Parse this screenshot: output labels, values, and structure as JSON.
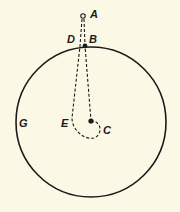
{
  "diagram": {
    "labels": {
      "A": "A",
      "B": "B",
      "C": "C",
      "D": "D",
      "E": "E",
      "G": "G"
    },
    "colors": {
      "background": "#fbf9e6",
      "ink": "#1a1a1a"
    },
    "elements": {
      "circle_G": {
        "cx": 91,
        "cy": 122,
        "r": 75
      },
      "point_A": {
        "x": 83,
        "y": 16,
        "style": "open"
      },
      "point_B": {
        "x": 85,
        "y": 46,
        "style": "filled"
      },
      "point_C": {
        "x": 91,
        "y": 121,
        "style": "filled"
      },
      "path_AB_C": "dashed line from A through B down to C",
      "path_A_D_E_loop": "dashed line from A through D down to E, looping under C"
    }
  }
}
